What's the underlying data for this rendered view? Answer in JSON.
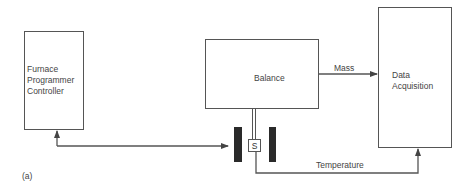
{
  "diagram": {
    "panel_label": "(a)",
    "nodes": [
      {
        "id": "furnace",
        "label_lines": [
          "Furnace",
          "Programmer",
          "Controller"
        ]
      },
      {
        "id": "balance",
        "label": "Balance"
      },
      {
        "id": "data_acquisition",
        "label_lines": [
          "Data",
          "Acquisition"
        ]
      },
      {
        "id": "sample",
        "label": "S"
      }
    ],
    "edges": [
      {
        "from": "balance",
        "to": "data_acquisition",
        "label": "Mass"
      },
      {
        "from": "sample",
        "to": "data_acquisition",
        "label": "Temperature"
      },
      {
        "from": "furnace",
        "to": "heater",
        "label": ""
      }
    ],
    "colors": {
      "line": "#555555",
      "heater": "#2a2a2a"
    }
  }
}
